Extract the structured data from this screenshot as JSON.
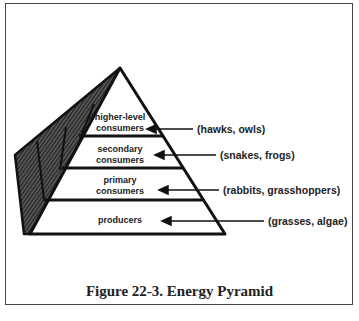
{
  "figure": {
    "caption": "Figure 22-3.  Energy Pyramid"
  },
  "pyramid": {
    "tiers": [
      {
        "label_line1": "higher-level",
        "label_line2": "consumers",
        "examples": "(hawks, owls)"
      },
      {
        "label_line1": "secondary",
        "label_line2": "consumers",
        "examples": "(snakes, frogs)"
      },
      {
        "label_line1": "primary",
        "label_line2": "consumers",
        "examples": "(rabbits, grasshoppers)"
      },
      {
        "label_line1": "producers",
        "label_line2": "",
        "examples": "(grasses, algae)"
      }
    ]
  },
  "colors": {
    "line": "#111111",
    "shade": "#333333",
    "text": "#222222"
  }
}
